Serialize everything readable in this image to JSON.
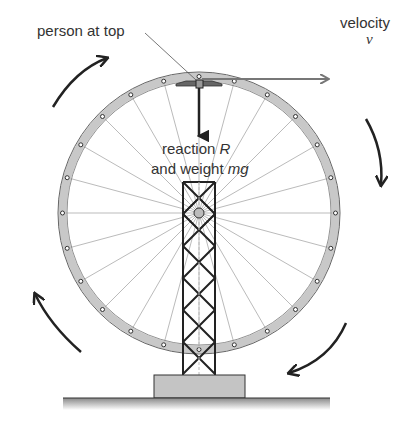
{
  "labels": {
    "person": "person at top",
    "velocity": "velocity",
    "velocity_symbol": "v",
    "reaction_line1_text": "reaction ",
    "reaction_symbol": "R",
    "reaction_line2_text": "and weight ",
    "weight_symbol": "mg"
  },
  "colors": {
    "rim_fill": "#c8c8c8",
    "rim_stroke": "#555555",
    "spoke": "#bbbbbb",
    "tower": "#222222",
    "base_fill": "#c4c4c4",
    "arrow": "#222222",
    "velocity_arrow": "#777777"
  },
  "wheel": {
    "cx": 199,
    "cy": 213,
    "outer_radius": 141,
    "rim_width": 9,
    "spokes": 24
  }
}
